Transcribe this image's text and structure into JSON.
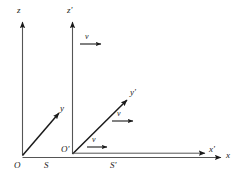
{
  "figure": {
    "stroke_color": "#1a1a1a",
    "background_color": "#ffffff"
  },
  "frames": [
    {
      "id": "S",
      "label": "S",
      "origin_label": "O",
      "x_axis_label": "x",
      "y_axis_label": "y",
      "z_axis_label": "z"
    },
    {
      "id": "Sp",
      "label": "S'",
      "origin_label": "O'",
      "x_axis_label": "x'",
      "y_axis_label": "y'",
      "z_axis_label": "z'"
    }
  ],
  "axes": {
    "z": "z",
    "z_prime": "z'",
    "y": "y",
    "y_prime": "y'",
    "x": "x",
    "x_prime": "x'"
  },
  "origins": {
    "O": "O",
    "O_prime": "O'"
  },
  "frame_names": {
    "S": "S",
    "S_prime": "S'"
  },
  "velocity_vectors": [
    {
      "name": "velocity-top",
      "label": "v"
    },
    {
      "name": "velocity-middle",
      "label": "v"
    },
    {
      "name": "velocity-bottom",
      "label": "v"
    }
  ],
  "velocity_symbol": "v"
}
